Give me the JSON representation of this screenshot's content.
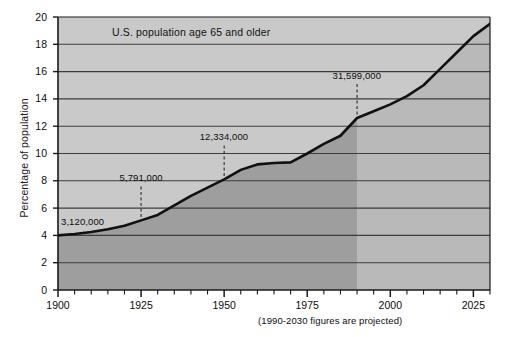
{
  "chart_data": {
    "type": "area",
    "title": "U.S. population age 65 and older",
    "xlabel": "",
    "ylabel": "Percentage of population",
    "xlim": [
      1900,
      2030
    ],
    "ylim": [
      0,
      20
    ],
    "ytick_labels": [
      "0",
      "2",
      "4",
      "6",
      "8",
      "10",
      "12",
      "14",
      "16",
      "18",
      "20"
    ],
    "yticks": [
      0,
      2,
      4,
      6,
      8,
      10,
      12,
      14,
      16,
      18,
      20
    ],
    "xtick_labels": [
      "1900",
      "1925",
      "1950",
      "1975",
      "2000",
      "2025"
    ],
    "xticks": [
      1900,
      1925,
      1950,
      1975,
      2000,
      2025
    ],
    "xtick_minor_step": 5,
    "grid": "horizontal",
    "legend": "none",
    "x": [
      1900,
      1905,
      1910,
      1915,
      1920,
      1925,
      1930,
      1935,
      1940,
      1945,
      1950,
      1955,
      1960,
      1965,
      1970,
      1975,
      1980,
      1985,
      1990,
      1995,
      2000,
      2005,
      2010,
      2015,
      2020,
      2025,
      2030
    ],
    "values": [
      4.0,
      4.1,
      4.25,
      4.45,
      4.7,
      5.1,
      5.5,
      6.2,
      6.9,
      7.5,
      8.1,
      8.8,
      9.2,
      9.3,
      9.35,
      10.0,
      10.7,
      11.3,
      12.6,
      13.1,
      13.6,
      14.2,
      15.0,
      16.2,
      17.4,
      18.6,
      19.5
    ],
    "annotations": [
      {
        "label": "3,120,000",
        "year": 1900,
        "value": 4.0,
        "leader": false
      },
      {
        "label": "5,791,000",
        "year": 1925,
        "value": 5.1,
        "leader": true
      },
      {
        "label": "12,334,000",
        "year": 1950,
        "value": 8.1,
        "leader": true
      },
      {
        "label": "31,599,000",
        "year": 1990,
        "value": 12.6,
        "leader": true
      }
    ],
    "projection_start_year": 1990,
    "footnote": "(1990-2030 figures are projected)",
    "colors": {
      "plot_background": "#c9c9c9",
      "area_fill_historical": "#9e9e9e",
      "area_fill_projected": "#c9c9c9",
      "line": "#111111",
      "gridline": "#3c3c3c",
      "axis": "#1a1a1a",
      "page_background": "#ffffff",
      "text": "#0d0d0d"
    }
  }
}
